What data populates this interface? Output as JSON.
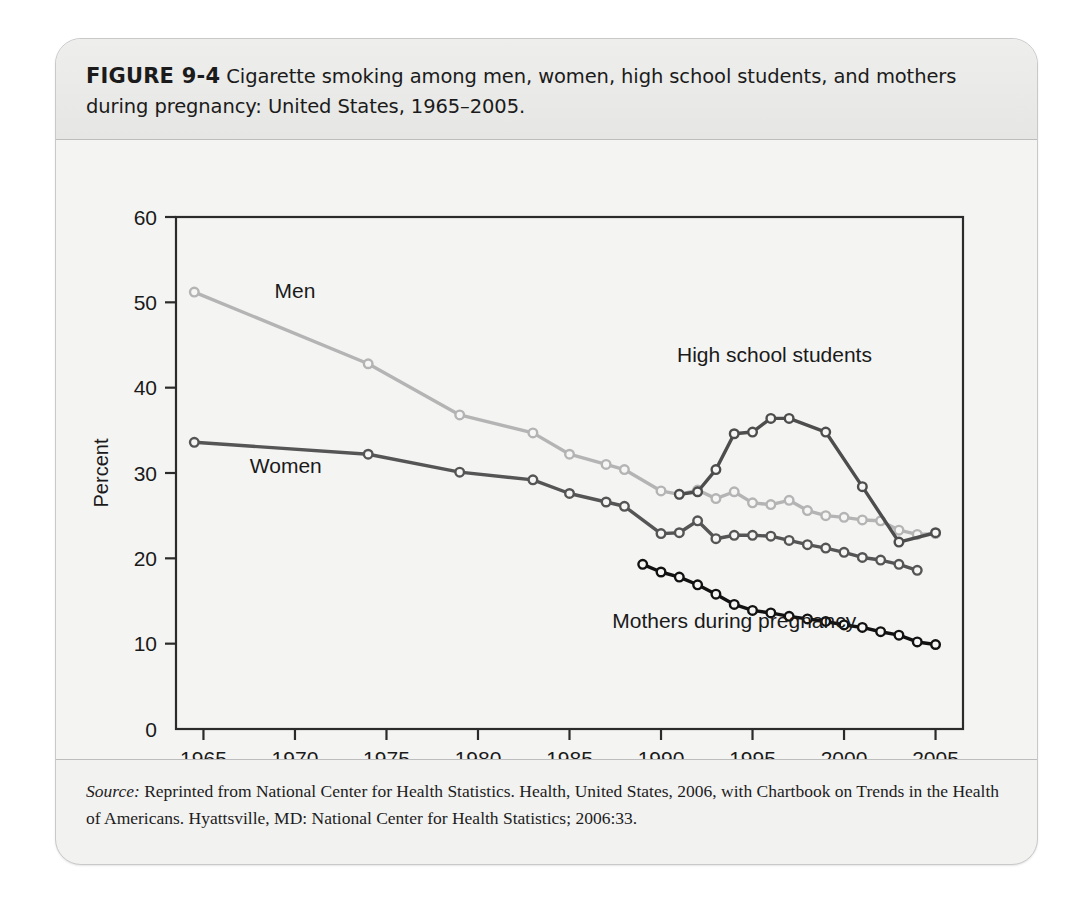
{
  "figure": {
    "number_label": "FIGURE 9-4",
    "caption": "Cigarette smoking among men, women, high school students, and mothers during pregnancy: United States, 1965–2005."
  },
  "source": {
    "label": "Source:",
    "text": " Reprinted from National Center for Health Statistics. Health, United States, 2006, with Chartbook on Trends in the Health of Americans. Hyattsville, MD: National Center for Health Statistics; 2006:33."
  },
  "chart_data": {
    "type": "line",
    "title": "",
    "xlabel": "Year",
    "ylabel": "Percent",
    "xlim": [
      1963.5,
      2006.5
    ],
    "ylim": [
      0,
      60
    ],
    "xticks": [
      1965,
      1970,
      1975,
      1980,
      1985,
      1990,
      1995,
      2000,
      2005
    ],
    "yticks": [
      0,
      10,
      20,
      30,
      40,
      50,
      60
    ],
    "grid": false,
    "legend": "inline-labels",
    "series": [
      {
        "name": "Men",
        "color": "#b4b4b4",
        "label_x": 1970.0,
        "label_y": 50.5,
        "points": [
          [
            1964.5,
            51.2
          ],
          [
            1974,
            42.8
          ],
          [
            1979,
            36.8
          ],
          [
            1983,
            34.7
          ],
          [
            1985,
            32.2
          ],
          [
            1987,
            31.0
          ],
          [
            1988,
            30.4
          ],
          [
            1990,
            27.9
          ],
          [
            1991,
            27.5
          ],
          [
            1992,
            28.0
          ],
          [
            1993,
            27.0
          ],
          [
            1994,
            27.8
          ],
          [
            1995,
            26.5
          ],
          [
            1996,
            26.3
          ],
          [
            1997,
            26.8
          ],
          [
            1998,
            25.6
          ],
          [
            1999,
            25.0
          ],
          [
            2000,
            24.8
          ],
          [
            2001,
            24.5
          ],
          [
            2002,
            24.4
          ],
          [
            2003,
            23.3
          ],
          [
            2004,
            22.8
          ],
          [
            2005,
            22.9
          ]
        ]
      },
      {
        "name": "Women",
        "color": "#555555",
        "label_x": 1969.5,
        "label_y": 30.0,
        "points": [
          [
            1964.5,
            33.6
          ],
          [
            1974,
            32.2
          ],
          [
            1979,
            30.1
          ],
          [
            1983,
            29.2
          ],
          [
            1985,
            27.6
          ],
          [
            1987,
            26.6
          ],
          [
            1988,
            26.1
          ],
          [
            1990,
            22.9
          ],
          [
            1991,
            23.0
          ],
          [
            1992,
            24.4
          ],
          [
            1993,
            22.3
          ],
          [
            1994,
            22.7
          ],
          [
            1995,
            22.7
          ],
          [
            1996,
            22.6
          ],
          [
            1997,
            22.1
          ],
          [
            1998,
            21.6
          ],
          [
            1999,
            21.2
          ],
          [
            2000,
            20.7
          ],
          [
            2001,
            20.1
          ],
          [
            2002,
            19.8
          ],
          [
            2003,
            19.3
          ],
          [
            2004,
            18.6
          ]
        ]
      },
      {
        "name": "High school students",
        "color": "#4d4d4d",
        "label_x": 1996.2,
        "label_y": 43.0,
        "points": [
          [
            1991,
            27.5
          ],
          [
            1992,
            27.8
          ],
          [
            1993,
            30.4
          ],
          [
            1994,
            34.6
          ],
          [
            1995,
            34.8
          ],
          [
            1996,
            36.4
          ],
          [
            1997,
            36.4
          ],
          [
            1999,
            34.8
          ],
          [
            2001,
            28.4
          ],
          [
            2003,
            21.9
          ],
          [
            2005,
            23.0
          ]
        ]
      },
      {
        "name": "Mothers during pregnancy",
        "color": "#121212",
        "label_x": 1994.0,
        "label_y": 11.8,
        "points": [
          [
            1989,
            19.3
          ],
          [
            1990,
            18.4
          ],
          [
            1991,
            17.8
          ],
          [
            1992,
            16.9
          ],
          [
            1993,
            15.8
          ],
          [
            1994,
            14.6
          ],
          [
            1995,
            13.9
          ],
          [
            1996,
            13.6
          ],
          [
            1997,
            13.2
          ],
          [
            1998,
            12.9
          ],
          [
            1999,
            12.6
          ],
          [
            2000,
            12.2
          ],
          [
            2001,
            11.9
          ],
          [
            2002,
            11.4
          ],
          [
            2003,
            11.0
          ],
          [
            2004,
            10.2
          ],
          [
            2005,
            9.9
          ]
        ]
      }
    ]
  }
}
